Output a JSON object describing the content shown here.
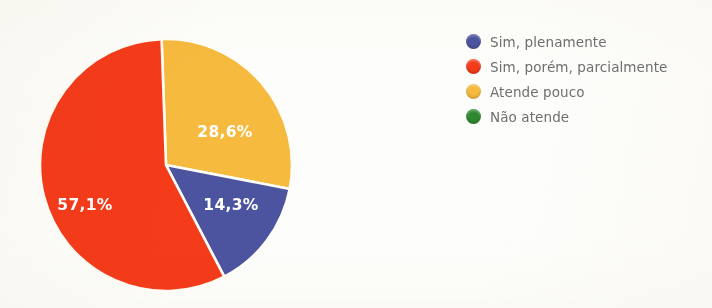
{
  "chart_data": {
    "type": "pie",
    "title": "",
    "labels": [
      "Sim, plenamente",
      "Sim, porém, parcialmente",
      "Atende pouco",
      "Não atende"
    ],
    "values": [
      14.3,
      57.1,
      28.6,
      0
    ],
    "value_labels": [
      "14,3%",
      "57,1%",
      "28,6%",
      ""
    ],
    "colors": [
      "#4c54a0",
      "#f43b1a",
      "#f6ba3e",
      "#2f8a2f"
    ],
    "slice_order_clockwise_from_top": [
      "Atende pouco",
      "Sim, plenamente",
      "Sim, porém, parcialmente"
    ],
    "start_angle_deg": -2,
    "legend_position": "right",
    "grid": false,
    "label_text_color": "#ffffff",
    "slice_separator_color": "#ffffff",
    "background": "#fdfdfb"
  },
  "legend": {
    "items": [
      {
        "label": "Sim, plenamente",
        "color": "#4c54a0",
        "swatch_name": "legend-swatch-blue"
      },
      {
        "label": "Sim, porém, parcialmente",
        "color": "#f43b1a",
        "swatch_name": "legend-swatch-red"
      },
      {
        "label": "Atende pouco",
        "color": "#f6ba3e",
        "swatch_name": "legend-swatch-yellow"
      },
      {
        "label": "Não atende",
        "color": "#2f8a2f",
        "swatch_name": "legend-swatch-green"
      }
    ]
  },
  "pie_labels": {
    "yellow": "28,6%",
    "red": "57,1%",
    "blue": "14,3%"
  }
}
